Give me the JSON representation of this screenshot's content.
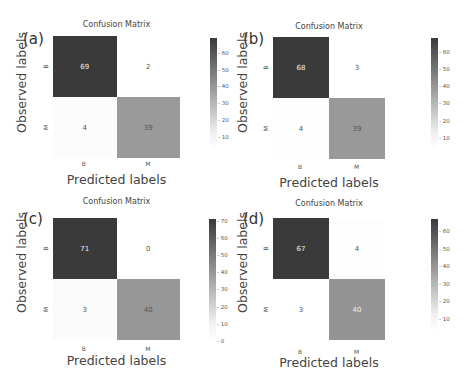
{
  "chart_data": [
    {
      "type": "heatmap",
      "panel": "(a)",
      "title": "Confusion Matrix",
      "xlabel": "Predicted labels",
      "ylabel": "Observed labels",
      "x_categories": [
        "B",
        "M"
      ],
      "y_categories": [
        "B",
        "M"
      ],
      "values": [
        [
          69,
          2
        ],
        [
          4,
          39
        ]
      ],
      "colorbar_ticks": [
        10,
        20,
        30,
        40,
        50,
        60
      ],
      "colorbar_range": [
        2,
        69
      ]
    },
    {
      "type": "heatmap",
      "panel": "(b)",
      "title": "Confusion Matrix",
      "xlabel": "Predicted labels",
      "ylabel": "Observed labels",
      "x_categories": [
        "B",
        "M"
      ],
      "y_categories": [
        "B",
        "M"
      ],
      "values": [
        [
          68,
          3
        ],
        [
          4,
          39
        ]
      ],
      "colorbar_ticks": [
        10,
        20,
        30,
        40,
        50,
        60
      ],
      "colorbar_range": [
        3,
        68
      ]
    },
    {
      "type": "heatmap",
      "panel": "(c)",
      "title": "Confusion Matrix",
      "xlabel": "Predicted labels",
      "ylabel": "Observed labels",
      "x_categories": [
        "B",
        "M"
      ],
      "y_categories": [
        "B",
        "M"
      ],
      "values": [
        [
          71,
          0
        ],
        [
          3,
          40
        ]
      ],
      "colorbar_ticks": [
        0,
        10,
        20,
        30,
        40,
        50,
        60,
        70
      ],
      "colorbar_range": [
        0,
        71
      ]
    },
    {
      "type": "heatmap",
      "panel": "(d)",
      "title": "Confusion Matrix",
      "xlabel": "Predicted labels",
      "ylabel": "Observed labels",
      "x_categories": [
        "B",
        "M"
      ],
      "y_categories": [
        "B",
        "M"
      ],
      "values": [
        [
          67,
          4
        ],
        [
          3,
          40
        ]
      ],
      "colorbar_ticks": [
        10,
        20,
        30,
        40,
        50,
        60
      ],
      "colorbar_range": [
        3,
        67
      ]
    }
  ]
}
